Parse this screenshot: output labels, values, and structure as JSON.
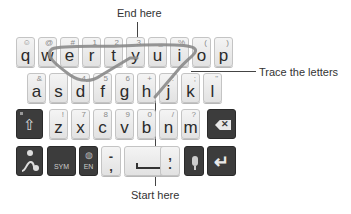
{
  "annotations": {
    "end": "End here",
    "trace": "Trace the letters",
    "start": "Start here"
  },
  "keyboard": {
    "row1": [
      {
        "main": "q",
        "sec": "☺"
      },
      {
        "main": "w",
        "sec": "@"
      },
      {
        "main": "e",
        "sec": "#"
      },
      {
        "main": "r",
        "sec": "1"
      },
      {
        "main": "t",
        "sec": "2"
      },
      {
        "main": "y",
        "sec": "3"
      },
      {
        "main": "u",
        "sec": "_"
      },
      {
        "main": "i",
        "sec": "%"
      },
      {
        "main": "o",
        "sec": "("
      },
      {
        "main": "p",
        "sec": ")"
      }
    ],
    "row2": [
      {
        "main": "a",
        "sec": "&"
      },
      {
        "main": "s",
        "sec": ""
      },
      {
        "main": "d",
        "sec": "4"
      },
      {
        "main": "f",
        "sec": "5"
      },
      {
        "main": "g",
        "sec": "6"
      },
      {
        "main": "h",
        "sec": "+"
      },
      {
        "main": "j",
        "sec": ":"
      },
      {
        "main": "k",
        "sec": ";"
      },
      {
        "main": "l",
        "sec": "\""
      }
    ],
    "row3": [
      {
        "main": "z",
        "sec": "!"
      },
      {
        "main": "x",
        "sec": "7"
      },
      {
        "main": "c",
        "sec": "8"
      },
      {
        "main": "v",
        "sec": "9"
      },
      {
        "main": "b",
        "sec": "0"
      },
      {
        "main": "n",
        "sec": "/"
      },
      {
        "main": "m",
        "sec": "?"
      }
    ],
    "row4": {
      "sym": "SYM",
      "lang": "EN",
      "dash_top": "-",
      "dash_bottom": ",",
      "comma_top": ",",
      "comma_bottom": "."
    },
    "icons": {
      "shift": "⇧",
      "backspace": "✕",
      "enter": "↵",
      "mic": "🎤",
      "globe": "◍",
      "swype": "swype-gesture"
    }
  },
  "colors": {
    "trace_path": "#8a8a8a",
    "light_key": "#ececec",
    "dark_key": "#3c3c3c"
  }
}
